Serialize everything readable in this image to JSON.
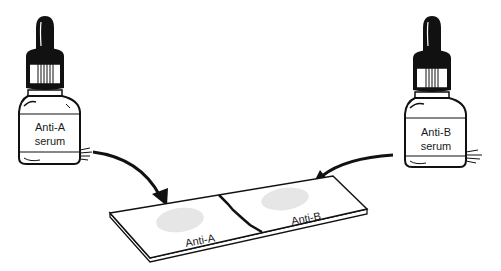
{
  "bottles": [
    {
      "id": "left",
      "label_line1": "Anti-A",
      "label_line2": "serum"
    },
    {
      "id": "right",
      "label_line1": "Anti-B",
      "label_line2": "serum"
    }
  ],
  "slide": {
    "left_label": "Anti-A",
    "right_label": "Anti-B"
  },
  "colors": {
    "ink": "#111111",
    "spot": "#e6e6e6",
    "background": "#ffffff"
  }
}
